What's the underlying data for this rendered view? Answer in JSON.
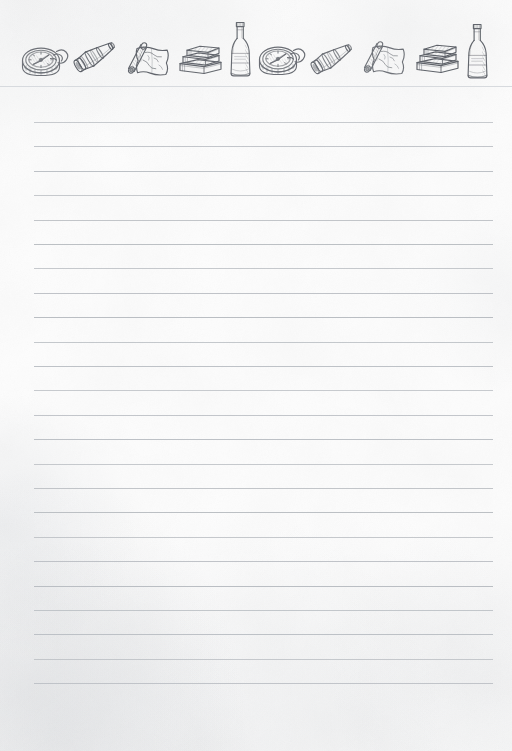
{
  "page": {
    "width": 512,
    "height": 751,
    "background_color": "#fdfdfd",
    "paper_tone": "#fdfdfd"
  },
  "header": {
    "name": "decorative-header-band",
    "height": 87,
    "separator_color": "#d7dade",
    "ink_color": "#5d6168",
    "pattern_description": "Hand-drawn pen-and-ink adventure objects repeated twice across the top",
    "icons": [
      {
        "name": "compass-icon",
        "label": "Compass",
        "index": 1
      },
      {
        "name": "spyglass-icon",
        "label": "Spyglass",
        "index": 2
      },
      {
        "name": "map-scroll-icon",
        "label": "Rolled Map",
        "index": 3
      },
      {
        "name": "book-stack-icon",
        "label": "Stack of Books",
        "index": 4
      },
      {
        "name": "bottle-icon",
        "label": "Bottle",
        "index": 5
      },
      {
        "name": "compass-icon",
        "label": "Compass",
        "index": 6
      },
      {
        "name": "spyglass-icon",
        "label": "Spyglass",
        "index": 7
      },
      {
        "name": "map-scroll-icon",
        "label": "Rolled Map",
        "index": 8
      },
      {
        "name": "book-stack-icon",
        "label": "Stack of Books",
        "index": 9
      },
      {
        "name": "bottle-icon",
        "label": "Bottle",
        "index": 10
      }
    ]
  },
  "ruled_area": {
    "name": "writing-lines",
    "line_color": "#b9bdc2",
    "line_left": 34,
    "line_right": 493,
    "line_width": 459,
    "first_line_y": 122,
    "line_spacing": 24.4,
    "line_count": 24,
    "content": "",
    "placeholder": ""
  }
}
